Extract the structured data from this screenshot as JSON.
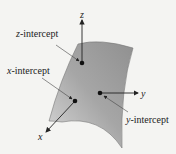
{
  "diagram": {
    "type": "3d-plane-intercepts",
    "axes": {
      "x": "x",
      "y": "y",
      "z": "z"
    },
    "labels": {
      "z_intercept": {
        "var": "z",
        "rest": "-intercept"
      },
      "x_intercept": {
        "var": "x",
        "rest": "-intercept"
      },
      "y_intercept": {
        "var": "y",
        "rest": "-intercept"
      }
    },
    "colors": {
      "surface_light": "#c8c8c8",
      "surface_dark": "#8e8e8e",
      "background": "#f4f4f2",
      "ink": "#222222"
    }
  }
}
